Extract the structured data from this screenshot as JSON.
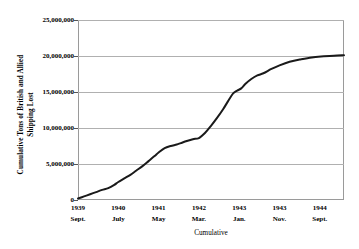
{
  "chart_data": {
    "type": "line",
    "title": "",
    "xlabel": "Cumulative",
    "ylabel": "Cumulative Tons of British and Allied Shipping Lost",
    "ylabel_line1": "Cumulative Tons of British and Allied",
    "ylabel_line2": "Shipping Lost",
    "grid": true,
    "legend": "none",
    "ylim": [
      0,
      25000000
    ],
    "yticks": [
      0,
      5000000,
      10000000,
      15000000,
      20000000,
      25000000
    ],
    "ytick_labels": [
      "0",
      "5,000,000",
      "10,000,000",
      "15,000,000",
      "20,000,000",
      "25,000,000"
    ],
    "xtick_labels": [
      {
        "year": "1939",
        "month": "Sept."
      },
      {
        "year": "1940",
        "month": "July"
      },
      {
        "year": "1941",
        "month": "May"
      },
      {
        "year": "1942",
        "month": "Mar."
      },
      {
        "year": "1943",
        "month": "Jan."
      },
      {
        "year": "1943",
        "month": "Nov."
      },
      {
        "year": "1944",
        "month": "Sept."
      }
    ],
    "xtick_positions": [
      0,
      1,
      2,
      3,
      4,
      5,
      6
    ],
    "xlim": [
      0,
      6.6
    ],
    "series": [
      {
        "name": "Cumulative British and Allied shipping lost",
        "color": "#1a1a1a",
        "x": [
          0.0,
          0.15,
          0.3,
          0.45,
          0.6,
          0.75,
          0.9,
          1.0,
          1.15,
          1.3,
          1.45,
          1.6,
          1.75,
          1.9,
          2.0,
          2.15,
          2.3,
          2.45,
          2.55,
          2.7,
          2.85,
          3.0,
          3.15,
          3.3,
          3.45,
          3.6,
          3.72,
          3.85,
          3.95,
          4.05,
          4.15,
          4.3,
          4.45,
          4.6,
          4.8,
          5.0,
          5.25,
          5.5,
          5.8,
          6.1,
          6.35,
          6.6
        ],
        "values": [
          200000,
          500000,
          800000,
          1100000,
          1400000,
          1650000,
          2100000,
          2500000,
          3000000,
          3500000,
          4100000,
          4700000,
          5400000,
          6100000,
          6600000,
          7200000,
          7500000,
          7700000,
          7900000,
          8200000,
          8450000,
          8600000,
          9300000,
          10300000,
          11400000,
          12600000,
          13700000,
          14800000,
          15200000,
          15500000,
          16100000,
          16800000,
          17300000,
          17600000,
          18200000,
          18700000,
          19200000,
          19500000,
          19800000,
          19950000,
          20050000,
          20100000
        ]
      }
    ]
  }
}
